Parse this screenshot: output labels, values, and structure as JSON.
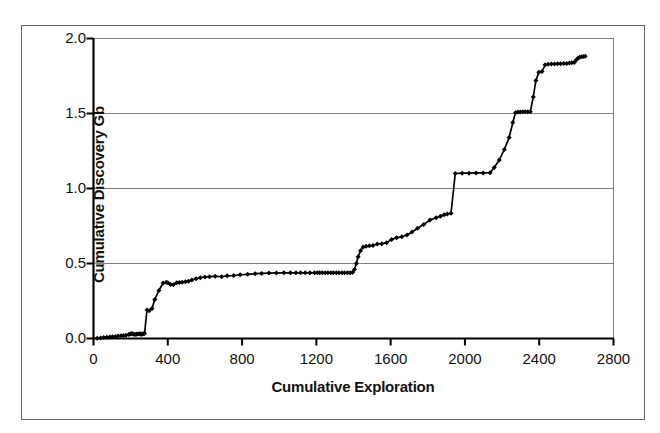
{
  "figure": {
    "background_color": "#ffffff",
    "frame_color": "#666666",
    "axis_color": "#000000",
    "grid_color": "#808080",
    "series_color": "#000000"
  },
  "chart_data": {
    "type": "line",
    "title": "",
    "subtitle": "",
    "xlabel": "Cumulative Exploration",
    "ylabel": "Cumulative Discovery Gb",
    "xlim": [
      0,
      2800
    ],
    "ylim": [
      0.0,
      2.0
    ],
    "xticks": [
      0,
      400,
      800,
      1200,
      1600,
      2000,
      2400,
      2800
    ],
    "xtick_labels": [
      "0",
      "400",
      "800",
      "1200",
      "1600",
      "2000",
      "2400",
      "2800"
    ],
    "yticks": [
      0.0,
      0.5,
      1.0,
      1.5,
      2.0
    ],
    "ytick_labels": [
      "0.0",
      "0.5",
      "1.0",
      "1.5",
      "2.0"
    ],
    "grid": "horizontal",
    "legend": "none",
    "marker": "diamond",
    "series": [
      {
        "name": "Cumulative Discovery",
        "x": [
          20,
          38,
          55,
          72,
          88,
          102,
          118,
          132,
          148,
          162,
          175,
          190,
          198,
          205,
          212,
          218,
          224,
          232,
          240,
          248,
          252,
          258,
          262,
          268,
          275,
          288,
          300,
          315,
          330,
          352,
          375,
          392,
          400,
          415,
          430,
          448,
          462,
          478,
          495,
          512,
          530,
          552,
          575,
          600,
          625,
          655,
          690,
          720,
          755,
          790,
          830,
          870,
          905,
          945,
          985,
          1025,
          1060,
          1090,
          1115,
          1140,
          1165,
          1190,
          1205,
          1218,
          1232,
          1248,
          1262,
          1278,
          1292,
          1308,
          1322,
          1338,
          1352,
          1368,
          1382,
          1395,
          1405,
          1415,
          1425,
          1438,
          1452,
          1468,
          1485,
          1505,
          1528,
          1552,
          1578,
          1605,
          1632,
          1660,
          1688,
          1715,
          1745,
          1778,
          1812,
          1845,
          1868,
          1888,
          1905,
          1925,
          1948,
          1985,
          2022,
          2060,
          2098,
          2135,
          2158,
          2185,
          2212,
          2238,
          2258,
          2272,
          2285,
          2298,
          2312,
          2325,
          2338,
          2352,
          2368,
          2382,
          2398,
          2415,
          2432,
          2448,
          2465,
          2482,
          2498,
          2515,
          2532,
          2548,
          2562,
          2575,
          2588,
          2598,
          2608,
          2618,
          2628,
          2638,
          2648
        ],
        "y": [
          0.002,
          0.004,
          0.006,
          0.008,
          0.01,
          0.012,
          0.014,
          0.016,
          0.018,
          0.02,
          0.022,
          0.026,
          0.03,
          0.034,
          0.03,
          0.028,
          0.026,
          0.028,
          0.03,
          0.032,
          0.03,
          0.028,
          0.03,
          0.032,
          0.034,
          0.19,
          0.185,
          0.2,
          0.26,
          0.32,
          0.37,
          0.375,
          0.372,
          0.36,
          0.358,
          0.372,
          0.374,
          0.375,
          0.378,
          0.382,
          0.39,
          0.398,
          0.405,
          0.41,
          0.412,
          0.415,
          0.412,
          0.418,
          0.42,
          0.425,
          0.428,
          0.432,
          0.434,
          0.436,
          0.437,
          0.438,
          0.438,
          0.438,
          0.438,
          0.438,
          0.438,
          0.438,
          0.438,
          0.438,
          0.438,
          0.438,
          0.438,
          0.438,
          0.438,
          0.438,
          0.438,
          0.438,
          0.438,
          0.438,
          0.438,
          0.44,
          0.46,
          0.5,
          0.545,
          0.585,
          0.61,
          0.615,
          0.618,
          0.62,
          0.63,
          0.632,
          0.638,
          0.66,
          0.672,
          0.678,
          0.69,
          0.71,
          0.735,
          0.76,
          0.79,
          0.805,
          0.815,
          0.825,
          0.83,
          0.835,
          1.1,
          1.102,
          1.102,
          1.104,
          1.104,
          1.105,
          1.14,
          1.19,
          1.26,
          1.34,
          1.44,
          1.505,
          1.51,
          1.51,
          1.512,
          1.512,
          1.512,
          1.512,
          1.61,
          1.72,
          1.775,
          1.78,
          1.825,
          1.828,
          1.83,
          1.83,
          1.832,
          1.832,
          1.834,
          1.834,
          1.836,
          1.838,
          1.84,
          1.855,
          1.868,
          1.875,
          1.878,
          1.88,
          1.882
        ]
      }
    ]
  }
}
